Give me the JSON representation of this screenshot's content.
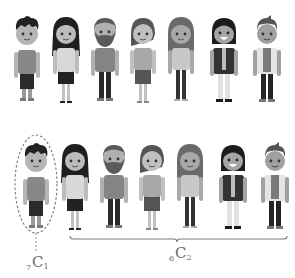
{
  "rows": [
    {
      "id": "top-row",
      "people": [
        {
          "name": "boy-spiky-hair",
          "x": 27,
          "y": 10
        },
        {
          "name": "girl-long-hair",
          "x": 66,
          "y": 10
        },
        {
          "name": "bearded-man",
          "x": 105,
          "y": 10
        },
        {
          "name": "woman-skirt",
          "x": 143,
          "y": 10
        },
        {
          "name": "woman-long-hair",
          "x": 181,
          "y": 10
        },
        {
          "name": "smiling-man-jacket",
          "x": 224,
          "y": 10
        },
        {
          "name": "man-white-coat",
          "x": 267,
          "y": 10
        }
      ]
    },
    {
      "id": "bottom-row",
      "people": [
        {
          "name": "boy-spiky-hair",
          "x": 36,
          "y": 137
        },
        {
          "name": "girl-long-hair",
          "x": 75,
          "y": 137
        },
        {
          "name": "bearded-man",
          "x": 114,
          "y": 137
        },
        {
          "name": "woman-skirt",
          "x": 152,
          "y": 137
        },
        {
          "name": "woman-long-hair",
          "x": 190,
          "y": 137
        },
        {
          "name": "smiling-man-jacket",
          "x": 233,
          "y": 137
        },
        {
          "name": "man-white-coat",
          "x": 275,
          "y": 137
        }
      ]
    }
  ],
  "annotations": {
    "left_label": {
      "pre": "7",
      "main": "C",
      "sub": "1"
    },
    "right_label": {
      "pre": "6",
      "main": "C",
      "sub": "2"
    }
  },
  "colors": {
    "skin": "#b9b9b9",
    "hair": "#2b2b2b",
    "shirt_mid": "#8a8a8a",
    "pants_dark": "#2e2e2e",
    "light": "#e6e6e6",
    "line": "#7a7a7a"
  }
}
